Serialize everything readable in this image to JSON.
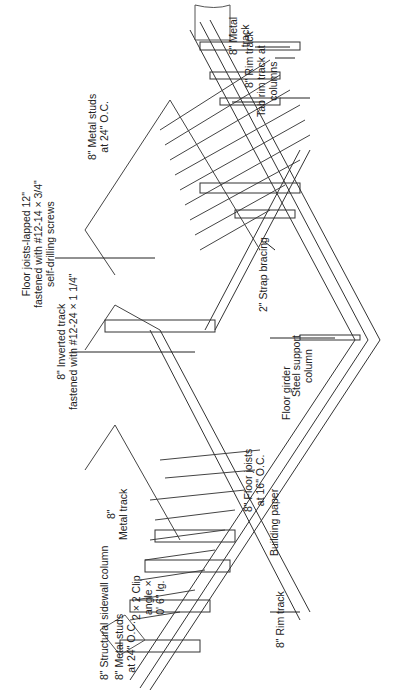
{
  "diagram": {
    "orientation": "rotated-90-ccw",
    "labels": {
      "floor_joists_lapped": [
        "Floor joists-lapped 12\"",
        "fastened with #12-14 × 3/4\"",
        "self-drilling screws"
      ],
      "inverted_track": [
        "8\" Inverted track",
        "fastened with #12-24 × 1 1/4\""
      ],
      "metal_studs_top": [
        "8\" Metal studs",
        "at 24\" O.C."
      ],
      "metal_track_top": [
        "8\" Metal",
        "track"
      ],
      "rim_track_top": [
        "8\" Rim track"
      ],
      "tab_rim_track": [
        "Tab rim track at",
        "columns"
      ],
      "strap_bracing": [
        "2\" Strap bracing"
      ],
      "steel_support_column": [
        "Steel support",
        "column"
      ],
      "floor_girder": [
        "Floor girder"
      ],
      "floor_joists_16": [
        "8\" Floor joists",
        "at 16\" O.C."
      ],
      "building_paper": [
        "Building paper"
      ],
      "rim_track_bottom": [
        "8\" Rim track"
      ],
      "structural_sidewall_column": [
        "8\" Structural sidewall column"
      ],
      "metal_track_bottom": [
        "8\"",
        "Metal track"
      ],
      "clip_angle": [
        "2 × 2 Clip",
        "angle ×",
        "0' 6\" lg."
      ],
      "metal_studs_bottom": [
        "8\" Metal studs",
        "at 24\" O.C."
      ]
    }
  }
}
